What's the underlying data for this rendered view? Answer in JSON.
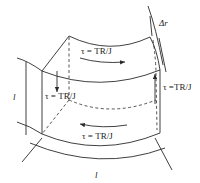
{
  "diagram": {
    "type": "shear-stress-element",
    "stroke_color": "#2a2a2a",
    "labels": {
      "stress_top": "τ = TR/J",
      "stress_bottom": "τ = TR/J",
      "stress_left": "τ = TR/J",
      "stress_right": "τ =TR/J",
      "thickness": "Δr",
      "height_dim": "l",
      "width_dim": "l"
    },
    "arrows": [
      {
        "face": "top",
        "direction": "right"
      },
      {
        "face": "bottom",
        "direction": "left"
      },
      {
        "face": "left",
        "direction": "down"
      },
      {
        "face": "right",
        "direction": "up"
      }
    ]
  }
}
